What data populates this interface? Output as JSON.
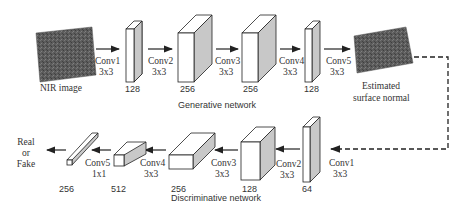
{
  "generative": {
    "title": "Generative network",
    "input_label": "NIR image",
    "output_label_line1": "Estimated",
    "output_label_line2": "surface normal",
    "convs": [
      {
        "name": "Conv1",
        "kernel": "3x3"
      },
      {
        "name": "Conv2",
        "kernel": "3x3"
      },
      {
        "name": "Conv3",
        "kernel": "3x3"
      },
      {
        "name": "Conv4",
        "kernel": "3x3"
      },
      {
        "name": "Conv5",
        "kernel": "3x3"
      }
    ],
    "channels": [
      "128",
      "256",
      "256",
      "128"
    ]
  },
  "discriminative": {
    "title": "Discriminative network",
    "output_label_line1": "Real",
    "output_label_line2": "or",
    "output_label_line3": "Fake",
    "convs": [
      {
        "name": "Conv1",
        "kernel": "3x3"
      },
      {
        "name": "Conv2",
        "kernel": "3x3"
      },
      {
        "name": "Conv3",
        "kernel": "3x3"
      },
      {
        "name": "Conv4",
        "kernel": "3x3"
      },
      {
        "name": "Conv5",
        "kernel": "1x1"
      }
    ],
    "channels": [
      "64",
      "128",
      "256",
      "512",
      "256"
    ]
  },
  "colors": {
    "block_front": "#ffffff",
    "block_side": "#c8c8c8",
    "stroke": "#222222",
    "image_fill": "#5a5a5a"
  }
}
